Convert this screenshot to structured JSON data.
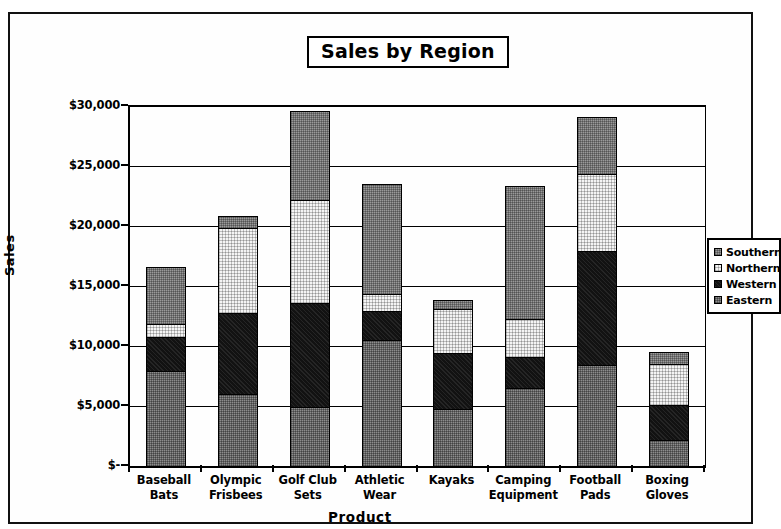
{
  "chart": {
    "title": "Sales by Region",
    "xlabel": "Product",
    "ylabel": "Sales"
  },
  "legend": {
    "items": [
      {
        "label": "Southern",
        "swatch": "southern-swatch"
      },
      {
        "label": "Northern",
        "swatch": "northern-swatch"
      },
      {
        "label": "Western",
        "swatch": "western-swatch"
      },
      {
        "label": "Eastern",
        "swatch": "eastern-swatch"
      }
    ]
  },
  "yaxis": {
    "ticks": [
      "$30,000",
      "$25,000",
      "$20,000",
      "$15,000",
      "$10,000",
      "$5,000",
      "$-"
    ]
  },
  "xaxis": {
    "categories": [
      {
        "line1": "Baseball",
        "line2": "Bats"
      },
      {
        "line1": "Olympic",
        "line2": "Frisbees"
      },
      {
        "line1": "Golf Club",
        "line2": "Sets"
      },
      {
        "line1": "Athletic",
        "line2": "Wear"
      },
      {
        "line1": "Kayaks",
        "line2": ""
      },
      {
        "line1": "Camping",
        "line2": "Equipment"
      },
      {
        "line1": "Football",
        "line2": "Pads"
      },
      {
        "line1": "Boxing",
        "line2": "Gloves"
      }
    ]
  },
  "chart_data": {
    "type": "bar",
    "stacked": true,
    "title": "Sales by Region",
    "xlabel": "Product",
    "ylabel": "Sales",
    "ylim": [
      0,
      30000
    ],
    "ytick_values": [
      0,
      5000,
      10000,
      15000,
      20000,
      25000,
      30000
    ],
    "ytick_labels": [
      "$-",
      "$5,000",
      "$10,000",
      "$15,000",
      "$20,000",
      "$25,000",
      "$30,000"
    ],
    "grid": true,
    "legend_position": "right",
    "categories": [
      "Baseball Bats",
      "Olympic Frisbees",
      "Golf Club Sets",
      "Athletic Wear",
      "Kayaks",
      "Camping Equipment",
      "Football Pads",
      "Boxing Gloves"
    ],
    "stack_order_bottom_to_top": [
      "Eastern",
      "Western",
      "Northern",
      "Southern"
    ],
    "series": [
      {
        "name": "Eastern",
        "color": "#8d8d8d",
        "values": [
          8000,
          6100,
          5000,
          10600,
          4900,
          6600,
          8500,
          2300
        ]
      },
      {
        "name": "Western",
        "color": "#121212",
        "values": [
          3000,
          6900,
          8800,
          2500,
          4700,
          2700,
          9600,
          3000
        ]
      },
      {
        "name": "Northern",
        "color": "#f4f4f4",
        "values": [
          1200,
          7200,
          8700,
          1600,
          3800,
          3300,
          6600,
          3500
        ]
      },
      {
        "name": "Southern",
        "color": "#9a9a9a",
        "values": [
          4800,
          1100,
          7500,
          9200,
          900,
          11200,
          4800,
          1100
        ]
      }
    ],
    "totals": [
      17000,
      21300,
      30000,
      23900,
      14300,
      23800,
      29500,
      9900
    ]
  }
}
